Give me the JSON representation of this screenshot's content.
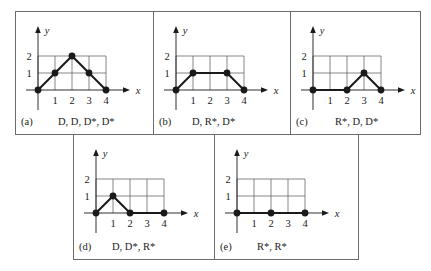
{
  "axes": {
    "x_label": "x",
    "y_label": "y",
    "x_ticks": [
      "1",
      "2",
      "3",
      "4"
    ],
    "y_ticks": [
      "1",
      "2"
    ]
  },
  "colors": {
    "line": "#1a1a1a",
    "grid": "#555555",
    "border": "#6b6b6b"
  },
  "panels": [
    {
      "id": "a",
      "tag": "(a)",
      "sequence": "D, D, D*, D*",
      "points": [
        [
          0,
          0
        ],
        [
          1,
          1
        ],
        [
          2,
          2
        ],
        [
          3,
          1
        ],
        [
          4,
          0
        ]
      ],
      "dots": [
        [
          0,
          0
        ],
        [
          1,
          1
        ],
        [
          2,
          2
        ],
        [
          3,
          1
        ],
        [
          4,
          0
        ]
      ]
    },
    {
      "id": "b",
      "tag": "(b)",
      "sequence": "D, R*, D*",
      "points": [
        [
          0,
          0
        ],
        [
          1,
          1
        ],
        [
          3,
          1
        ],
        [
          4,
          0
        ]
      ],
      "dots": [
        [
          0,
          0
        ],
        [
          1,
          1
        ],
        [
          3,
          1
        ],
        [
          4,
          0
        ]
      ]
    },
    {
      "id": "c",
      "tag": "(c)",
      "sequence": "R*, D, D*",
      "points": [
        [
          0,
          0
        ],
        [
          2,
          0
        ],
        [
          3,
          1
        ],
        [
          4,
          0
        ]
      ],
      "dots": [
        [
          0,
          0
        ],
        [
          2,
          0
        ],
        [
          3,
          1
        ],
        [
          4,
          0
        ]
      ]
    },
    {
      "id": "d",
      "tag": "(d)",
      "sequence": "D, D*, R*",
      "points": [
        [
          0,
          0
        ],
        [
          1,
          1
        ],
        [
          2,
          0
        ],
        [
          4,
          0
        ]
      ],
      "dots": [
        [
          0,
          0
        ],
        [
          1,
          1
        ],
        [
          2,
          0
        ],
        [
          4,
          0
        ]
      ]
    },
    {
      "id": "e",
      "tag": "(e)",
      "sequence": "R*, R*",
      "points": [
        [
          0,
          0
        ],
        [
          2,
          0
        ],
        [
          4,
          0
        ]
      ],
      "dots": [
        [
          0,
          0
        ],
        [
          2,
          0
        ],
        [
          4,
          0
        ]
      ]
    }
  ],
  "chart_data": [
    {
      "type": "line",
      "title": "(a) D, D, D*, D*",
      "x": [
        0,
        1,
        2,
        3,
        4
      ],
      "y": [
        0,
        1,
        2,
        1,
        0
      ],
      "xlabel": "x",
      "ylabel": "y",
      "xlim": [
        0,
        4
      ],
      "ylim": [
        0,
        2
      ],
      "grid": true
    },
    {
      "type": "line",
      "title": "(b) D, R*, D*",
      "x": [
        0,
        1,
        3,
        4
      ],
      "y": [
        0,
        1,
        1,
        0
      ],
      "xlabel": "x",
      "ylabel": "y",
      "xlim": [
        0,
        4
      ],
      "ylim": [
        0,
        2
      ],
      "grid": true
    },
    {
      "type": "line",
      "title": "(c) R*, D, D*",
      "x": [
        0,
        2,
        3,
        4
      ],
      "y": [
        0,
        0,
        1,
        0
      ],
      "xlabel": "x",
      "ylabel": "y",
      "xlim": [
        0,
        4
      ],
      "ylim": [
        0,
        2
      ],
      "grid": true
    },
    {
      "type": "line",
      "title": "(d) D, D*, R*",
      "x": [
        0,
        1,
        2,
        4
      ],
      "y": [
        0,
        1,
        0,
        0
      ],
      "xlabel": "x",
      "ylabel": "y",
      "xlim": [
        0,
        4
      ],
      "ylim": [
        0,
        2
      ],
      "grid": true
    },
    {
      "type": "line",
      "title": "(e) R*, R*",
      "x": [
        0,
        2,
        4
      ],
      "y": [
        0,
        0,
        0
      ],
      "xlabel": "x",
      "ylabel": "y",
      "xlim": [
        0,
        4
      ],
      "ylim": [
        0,
        2
      ],
      "grid": true
    }
  ]
}
